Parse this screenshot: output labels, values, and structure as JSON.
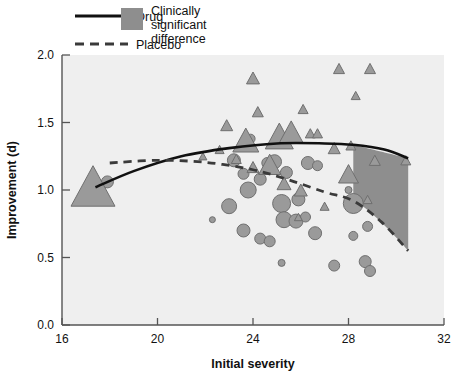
{
  "legend": {
    "items": [
      {
        "key": "drug",
        "label": "Drug",
        "style": "solid-line",
        "color": "#1a1a1a"
      },
      {
        "key": "placebo",
        "label": "Placebo",
        "style": "dashed-line",
        "color": "#3a3a3a"
      },
      {
        "key": "band",
        "label_line1": "Clinically",
        "label_line2": "significant",
        "label_line3": "difference",
        "style": "swatch",
        "color": "#8e8e8e"
      }
    ]
  },
  "chart_data": {
    "type": "scatter",
    "title": "",
    "xlabel": "Initial severity",
    "ylabel": "Improvement (d)",
    "xlim": [
      16,
      32
    ],
    "ylim": [
      0.0,
      2.0
    ],
    "xticks": [
      16,
      20,
      24,
      28,
      32
    ],
    "yticks": [
      "0.0",
      "0.5",
      "1.0",
      "1.5",
      "2.0"
    ],
    "grid": false,
    "plot_background": "#efefef",
    "marker_fill": "#9a9a9a",
    "marker_stroke": "#6f6f6f",
    "legend_position": "above-top-left",
    "annotations": [
      {
        "name": "clinically-significant-band",
        "x_start": 28.2,
        "x_end": 30.5,
        "fill": "#8e8e8e",
        "upper_from": 1.335,
        "upper_to": 1.235,
        "lower_from": 0.92,
        "lower_to": 0.55
      }
    ],
    "series": [
      {
        "name": "Drug",
        "marker": "triangle",
        "type": "scatter",
        "points": [
          {
            "x": 17.3,
            "y": 1.03,
            "size": 44
          },
          {
            "x": 23.7,
            "y": 1.37,
            "size": 26
          },
          {
            "x": 24.0,
            "y": 1.17,
            "size": 12
          },
          {
            "x": 23.3,
            "y": 1.23,
            "size": 10
          },
          {
            "x": 22.6,
            "y": 1.3,
            "size": 9
          },
          {
            "x": 22.9,
            "y": 1.48,
            "size": 12
          },
          {
            "x": 24.2,
            "y": 1.58,
            "size": 11
          },
          {
            "x": 24.0,
            "y": 1.83,
            "size": 13
          },
          {
            "x": 25.1,
            "y": 1.4,
            "size": 28
          },
          {
            "x": 25.6,
            "y": 1.43,
            "size": 24
          },
          {
            "x": 24.7,
            "y": 1.19,
            "size": 22
          },
          {
            "x": 25.3,
            "y": 1.05,
            "size": 14
          },
          {
            "x": 26.0,
            "y": 1.0,
            "size": 13
          },
          {
            "x": 26.4,
            "y": 1.42,
            "size": 10
          },
          {
            "x": 26.7,
            "y": 1.42,
            "size": 10
          },
          {
            "x": 26.1,
            "y": 1.6,
            "size": 10
          },
          {
            "x": 27.4,
            "y": 1.31,
            "size": 12
          },
          {
            "x": 27.0,
            "y": 0.88,
            "size": 9
          },
          {
            "x": 28.1,
            "y": 1.33,
            "size": 10
          },
          {
            "x": 28.0,
            "y": 1.12,
            "size": 20
          },
          {
            "x": 28.3,
            "y": 1.7,
            "size": 9
          },
          {
            "x": 27.6,
            "y": 1.9,
            "size": 11
          },
          {
            "x": 28.9,
            "y": 1.9,
            "size": 11
          },
          {
            "x": 29.1,
            "y": 1.22,
            "size": 11
          },
          {
            "x": 28.8,
            "y": 0.93,
            "size": 9
          },
          {
            "x": 30.4,
            "y": 1.22,
            "size": 10
          },
          {
            "x": 21.9,
            "y": 1.25,
            "size": 8
          },
          {
            "x": 25.9,
            "y": 0.8,
            "size": 8
          }
        ],
        "curve": {
          "name": "drug-fit",
          "style": "solid",
          "color": "#111111",
          "width": 2.6,
          "x": [
            17.4,
            19.0,
            21.0,
            23.0,
            25.0,
            27.0,
            28.2,
            29.5,
            30.5
          ],
          "y": [
            1.02,
            1.14,
            1.25,
            1.31,
            1.345,
            1.345,
            1.335,
            1.3,
            1.235
          ]
        }
      },
      {
        "name": "Placebo",
        "marker": "circle",
        "type": "scatter",
        "points": [
          {
            "x": 17.9,
            "y": 1.06,
            "size": 12
          },
          {
            "x": 23.2,
            "y": 1.22,
            "size": 13
          },
          {
            "x": 23.6,
            "y": 1.12,
            "size": 11
          },
          {
            "x": 23.8,
            "y": 1.0,
            "size": 16
          },
          {
            "x": 24.3,
            "y": 1.08,
            "size": 12
          },
          {
            "x": 24.6,
            "y": 1.2,
            "size": 11
          },
          {
            "x": 24.9,
            "y": 1.21,
            "size": 14
          },
          {
            "x": 25.4,
            "y": 1.13,
            "size": 12
          },
          {
            "x": 25.2,
            "y": 0.9,
            "size": 18
          },
          {
            "x": 25.9,
            "y": 0.93,
            "size": 13
          },
          {
            "x": 26.3,
            "y": 1.2,
            "size": 13
          },
          {
            "x": 26.7,
            "y": 1.18,
            "size": 10
          },
          {
            "x": 23.0,
            "y": 0.88,
            "size": 15
          },
          {
            "x": 23.6,
            "y": 0.7,
            "size": 13
          },
          {
            "x": 24.3,
            "y": 0.64,
            "size": 11
          },
          {
            "x": 24.7,
            "y": 0.62,
            "size": 11
          },
          {
            "x": 25.3,
            "y": 0.78,
            "size": 16
          },
          {
            "x": 25.8,
            "y": 0.77,
            "size": 14
          },
          {
            "x": 26.6,
            "y": 0.68,
            "size": 13
          },
          {
            "x": 22.3,
            "y": 0.78,
            "size": 6
          },
          {
            "x": 25.2,
            "y": 0.46,
            "size": 7
          },
          {
            "x": 27.4,
            "y": 0.44,
            "size": 11
          },
          {
            "x": 28.2,
            "y": 0.9,
            "size": 20
          },
          {
            "x": 28.0,
            "y": 1.0,
            "size": 7
          },
          {
            "x": 28.8,
            "y": 0.73,
            "size": 10
          },
          {
            "x": 28.2,
            "y": 0.66,
            "size": 9
          },
          {
            "x": 28.7,
            "y": 0.47,
            "size": 12
          },
          {
            "x": 28.9,
            "y": 0.4,
            "size": 11
          },
          {
            "x": 23.9,
            "y": 1.38,
            "size": 9
          },
          {
            "x": 26.2,
            "y": 0.8,
            "size": 10
          }
        ],
        "curve": {
          "name": "placebo-fit",
          "style": "dashed",
          "color": "#3a3a3a",
          "width": 2.8,
          "dash": "8,6",
          "x": [
            18.0,
            20.0,
            22.0,
            24.0,
            25.5,
            27.0,
            28.2,
            29.4,
            30.5
          ],
          "y": [
            1.2,
            1.22,
            1.205,
            1.15,
            1.075,
            0.985,
            0.92,
            0.76,
            0.55
          ]
        }
      }
    ]
  }
}
